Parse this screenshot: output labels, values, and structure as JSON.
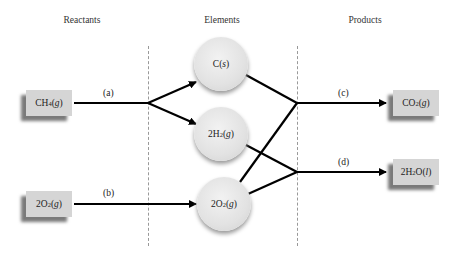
{
  "headings": {
    "reactants": "Reactants",
    "elements": "Elements",
    "products": "Products"
  },
  "reactants": [
    {
      "coef": "",
      "formula": "CH",
      "sub": "4",
      "state": "g"
    },
    {
      "coef": "2",
      "formula": "O",
      "sub": "2",
      "state": "g"
    }
  ],
  "elements": [
    {
      "coef": "",
      "formula": "C",
      "sub": "",
      "state": "s"
    },
    {
      "coef": "2",
      "formula": "H",
      "sub": "2",
      "state": "g"
    },
    {
      "coef": "2",
      "formula": "O",
      "sub": "2",
      "state": "g"
    }
  ],
  "products": [
    {
      "coef": "",
      "formula": "CO",
      "sub": "2",
      "state": "g"
    },
    {
      "coef": "2",
      "formula": "H",
      "sub": "2",
      "tail": "O",
      "state": "l"
    }
  ],
  "step_labels": {
    "a": "(a)",
    "b": "(b)",
    "c": "(c)",
    "d": "(d)"
  },
  "colors": {
    "box": "#d5d5d5",
    "box_shadow": "#7a7a7a",
    "circle": "#e2e2e2",
    "line": "#000000",
    "divider": "#999999"
  }
}
